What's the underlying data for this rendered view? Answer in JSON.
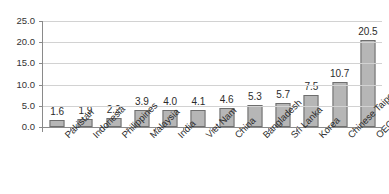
{
  "chart_data": {
    "type": "bar",
    "title": "",
    "subtitle": "",
    "xlabel": "",
    "ylabel": "",
    "ylim": [
      0.0,
      25.0
    ],
    "ytick_labels": [
      "0.0",
      "5.0",
      "10.0",
      "15.0",
      "20.0",
      "25.0"
    ],
    "ytick_values": [
      0.0,
      5.0,
      10.0,
      15.0,
      20.0,
      25.0
    ],
    "grid": true,
    "legend": "none",
    "categories": [
      "Pakistan",
      "Indonesia",
      "Philippines",
      "Malaysia",
      "India",
      "Viet Nam",
      "China",
      "Bangladesh",
      "Sri Lanka",
      "Korea",
      "Chinese Taipei",
      "OECD-30"
    ],
    "values": [
      1.6,
      1.9,
      2.2,
      3.9,
      4.0,
      4.1,
      4.6,
      5.3,
      5.7,
      7.5,
      10.7,
      20.5
    ],
    "data_labels": [
      "1.6",
      "1.9",
      "2.2",
      "3.9",
      "4.0",
      "4.1",
      "4.6",
      "5.3",
      "5.7",
      "7.5",
      "10.7",
      "20.5"
    ],
    "series": [
      {
        "name": "",
        "values": [
          1.6,
          1.9,
          2.2,
          3.9,
          4.0,
          4.1,
          4.6,
          5.3,
          5.7,
          7.5,
          10.7,
          20.5
        ]
      }
    ],
    "colors": {
      "bar_fill": "#b6b6b6",
      "bar_border": "#6e6e6e",
      "gridline": "#d2d2d2",
      "axis": "#8a8a8a",
      "text": "#2b2b2b",
      "background": "#ffffff"
    }
  }
}
